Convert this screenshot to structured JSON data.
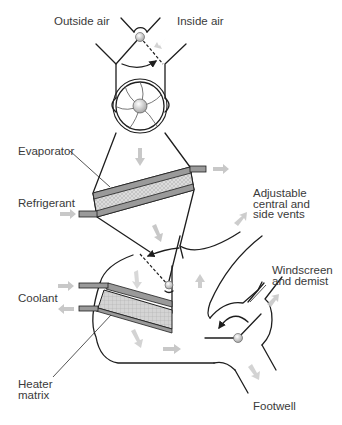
{
  "diagram": {
    "labels": {
      "outside_air": "Outside air",
      "inside_air": "Inside air",
      "evaporator": "Evaporator",
      "refrigerant": "Refrigerant",
      "adjustable_vents": "Adjustable\ncentral and\nside vents",
      "windscreen": "Windscreen\nand demist",
      "coolant": "Coolant",
      "heater_matrix": "Heater\nmatrix",
      "footwell": "Footwell"
    },
    "components": [
      "recirculation flap",
      "blower fan",
      "evaporator",
      "blend flap",
      "heater matrix",
      "distribution flap"
    ],
    "colors": {
      "line": "#1e1e1e",
      "flow_arrow": "#c8c8c8",
      "core_fill": "#d8d8d8",
      "pipe": "#9a9a9a",
      "text": "#3a3a3a"
    }
  }
}
